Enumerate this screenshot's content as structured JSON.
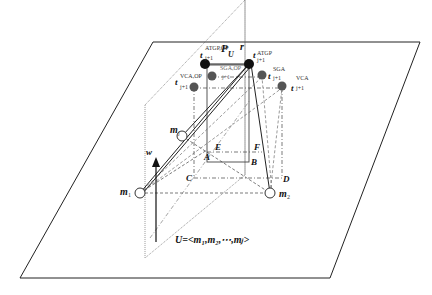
{
  "diagram": {
    "plane_label": "P",
    "plane_sub": "U",
    "plane_sub2": "j",
    "axis_r": "r",
    "axis_w": "w",
    "points": {
      "A": "A",
      "B": "B",
      "C": "C",
      "D": "D",
      "E": "E",
      "F": "F"
    },
    "nodes": {
      "m1": "m",
      "m1_sub": "1",
      "m2": "m",
      "m2_sub": "2",
      "mj": "m",
      "mj_sub": "j"
    },
    "targets": {
      "t_atgp_op": {
        "base": "t",
        "sup": "ATGP,OP",
        "sub": "j+1"
      },
      "t_atgp": {
        "base": "t",
        "sup": "ATGP",
        "sub": "j+1"
      },
      "t_sga_op": {
        "base": "t",
        "sup": "SGA,OP",
        "sub": "j+1"
      },
      "t_sga": {
        "base": "t",
        "sup": "SGA",
        "sub": "j+1"
      },
      "t_vca_op": {
        "base": "t",
        "sup": "VCA,OP",
        "sub": "j+1"
      },
      "t_vca": {
        "base": "t",
        "sup": "VCA",
        "sub": "j+1"
      }
    },
    "set_label": "U=<m₁,m₂,⋯,mⱼ>"
  }
}
